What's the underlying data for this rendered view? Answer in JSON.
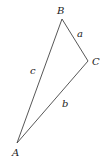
{
  "diagram": {
    "type": "triangle",
    "stroke_color": "#444444",
    "vertices": [
      {
        "name": "A",
        "x": 17,
        "y": 143,
        "label_x": 12,
        "label_y": 156
      },
      {
        "name": "B",
        "x": 62,
        "y": 19,
        "label_x": 57,
        "label_y": 14
      },
      {
        "name": "C",
        "x": 88,
        "y": 61,
        "label_x": 92,
        "label_y": 65
      }
    ],
    "sides": [
      {
        "name": "a",
        "between": "B-C",
        "label_x": 77,
        "label_y": 37
      },
      {
        "name": "b",
        "between": "A-C",
        "label_x": 62,
        "label_y": 107
      },
      {
        "name": "c",
        "between": "A-B",
        "label_x": 30,
        "label_y": 74
      }
    ]
  }
}
